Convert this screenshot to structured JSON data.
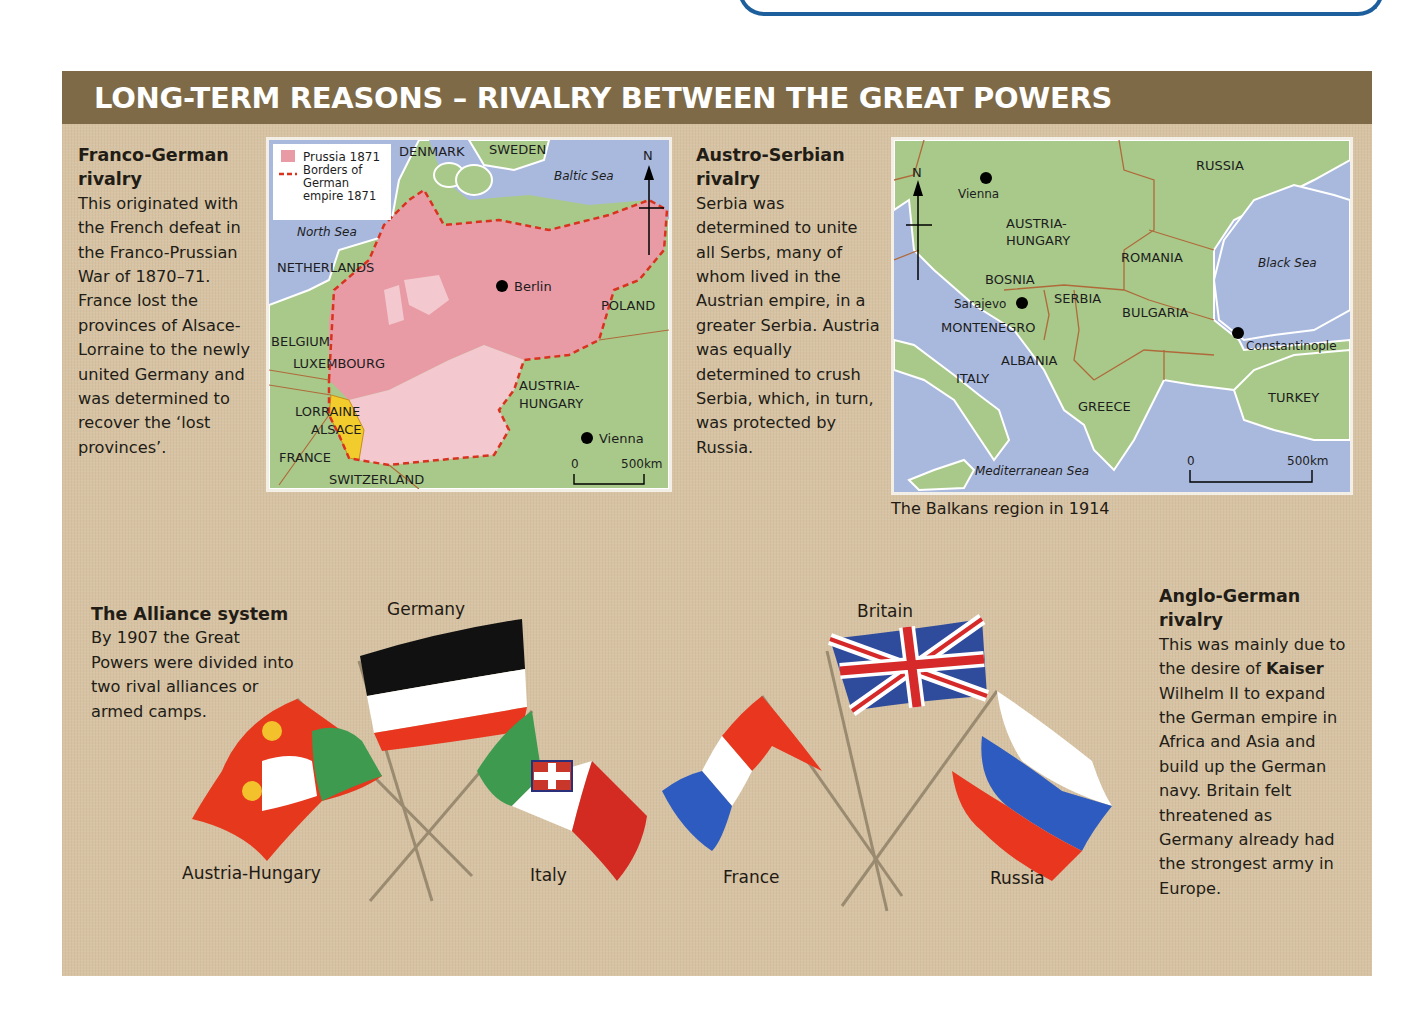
{
  "page": {
    "title": "LONG-TERM REASONS – RIVALRY BETWEEN THE GREAT POWERS",
    "colors": {
      "header_bg": "#7e6a46",
      "panel_bg": "#d7c3a3",
      "sea": "#a9b9de",
      "land": "#a8c98a",
      "prussia": "#e89aa5",
      "border_dash": "#d9321f",
      "alsace": "#f2cc2c",
      "top_box_border": "#1d5f9c"
    }
  },
  "franco_german": {
    "heading": "Franco-German rivalry",
    "body": "This originated with the French defeat in the Franco-Prussian War of 1870–71. France lost the provinces of Alsace-Lorraine to the newly united Germany and was determined to recover the ‘lost provinces’."
  },
  "germany_map": {
    "legend": {
      "prussia": "Prussia 1871",
      "borders": "Borders of German empire 1871"
    },
    "labels": {
      "denmark": "DENMARK",
      "sweden": "SWEDEN",
      "baltic_sea": "Baltic Sea",
      "north": "N",
      "north_sea": "North Sea",
      "netherlands": "NETHERLANDS",
      "berlin": "Berlin",
      "poland": "POLAND",
      "belgium": "BELGIUM",
      "luxembourg": "LUXEMBOURG",
      "lorraine": "LORRAINE",
      "alsace": "ALSACE",
      "france": "FRANCE",
      "switzerland": "SWITZERLAND",
      "austria1": "AUSTRIA-",
      "austria2": "HUNGARY",
      "vienna": "Vienna",
      "scale_0": "0",
      "scale_500": "500km"
    }
  },
  "austro_serbian": {
    "heading": "Austro-Serbian rivalry",
    "body": "Serbia was determined to unite all Serbs, many of whom lived in the Austrian empire, in a greater Serbia. Austria was equally determined to crush Serbia, which, in turn, was protected by Russia."
  },
  "balkans_map": {
    "caption": "The Balkans region in 1914",
    "labels": {
      "north": "N",
      "vienna": "Vienna",
      "russia": "RUSSIA",
      "austria1": "AUSTRIA-",
      "austria2": "HUNGARY",
      "romania": "ROMANIA",
      "black_sea": "Black Sea",
      "bosnia": "BOSNIA",
      "sarajevo": "Sarajevo",
      "serbia": "SERBIA",
      "bulgaria": "BULGARIA",
      "montenegro": "MONTENEGRO",
      "constantinople": "Constantinople",
      "albania": "ALBANIA",
      "italy": "ITALY",
      "greece": "GREECE",
      "turkey": "TURKEY",
      "mediterranean": "Mediterranean Sea",
      "scale_0": "0",
      "scale_500": "500km"
    }
  },
  "alliance": {
    "heading": "The Alliance system",
    "body": "By 1907 the Great Powers were divided into two rival alliances or armed camps.",
    "flags": {
      "germany": "Germany",
      "austria_hungary": "Austria-Hungary",
      "italy": "Italy",
      "britain": "Britain",
      "france": "France",
      "russia": "Russia"
    }
  },
  "anglo_german": {
    "heading": "Anglo-German rivalry",
    "body_before": "This was mainly due to the desire of",
    "body_bold": "Kaiser",
    "body_after": "Wilhelm II to expand the German empire in Africa and Asia and build up the German navy. Britain felt threatened as Germany already had the strongest army in Europe."
  }
}
